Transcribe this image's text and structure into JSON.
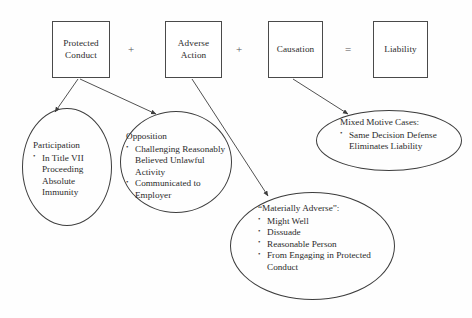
{
  "diagram": {
    "background_color": "#fefefe",
    "stroke_color": "#3d3d3d",
    "text_color": "#2b2b2b",
    "equation": {
      "plus_1": "+",
      "plus_2": "+",
      "equals": "="
    },
    "boxes": {
      "protected_conduct": {
        "line_1": "Protected",
        "line_2": "Conduct"
      },
      "adverse_action": {
        "line_1": "Adverse",
        "line_2": "Action"
      },
      "causation": {
        "line_1": "Causation"
      },
      "liability": {
        "line_1": "Liability"
      }
    },
    "ellipses": {
      "participation": {
        "heading": "Participation",
        "bullets": [
          "In Title VII Proceeding Absolute Immunity"
        ]
      },
      "opposition": {
        "heading": "Opposition",
        "bullets": [
          "Challenging Reasonably Believed Unlawful Activity",
          "Communicated to Employer"
        ]
      },
      "mixed_motive": {
        "heading": "Mixed Motive Cases:",
        "bullets": [
          "Same Decision Defense Eliminates Liability"
        ]
      },
      "materially_adverse": {
        "heading": "“Materially Adverse”:",
        "bullets": [
          "Might Well",
          "Dissuade",
          "Reasonable Person",
          "From Engaging in Protected Conduct"
        ]
      }
    },
    "arrows": [
      {
        "from": "protected_conduct",
        "to": "participation"
      },
      {
        "from": "protected_conduct",
        "to": "opposition"
      },
      {
        "from": "adverse_action",
        "to": "materially_adverse"
      },
      {
        "from": "causation",
        "to": "mixed_motive"
      }
    ]
  }
}
